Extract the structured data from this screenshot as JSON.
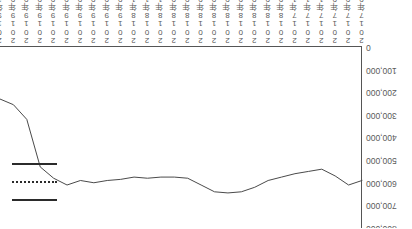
{
  "chart_data": {
    "type": "line",
    "title": "",
    "subtitle": "",
    "xlabel": "",
    "ylabel": "",
    "orientation": "rotated-180",
    "grid": false,
    "legend_position": "plot-left",
    "ylim": [
      0,
      800000
    ],
    "ytick_labels": [
      "0",
      "100,000",
      "200,000",
      "300,000",
      "400,000",
      "500,000",
      "600,000",
      "700,000",
      "800,000"
    ],
    "ytick_values": [
      0,
      100000,
      200000,
      300000,
      400000,
      500000,
      600000,
      700000,
      800000
    ],
    "categories": [
      "2017年07月",
      "2017年08月",
      "2017年09月",
      "2017年10月",
      "2017年11月",
      "2017年12月",
      "2018年01月",
      "2018年02月",
      "2018年03月",
      "2018年04月",
      "2018年05月",
      "2018年06月",
      "2018年07月",
      "2018年08月",
      "2018年09月",
      "2018年10月",
      "2018年11月",
      "2018年12月",
      "2019年01月",
      "2019年02月",
      "2019年03月",
      "2019年04月",
      "2019年05月",
      "2019年06月",
      "2019年07月",
      "2019年08月",
      "2019年09月",
      "2019年10月"
    ],
    "series": [
      {
        "name": "",
        "style": "solid",
        "color": "#4a4a4a",
        "values": [
          590000,
          610000,
          570000,
          540000,
          550000,
          560000,
          575000,
          590000,
          620000,
          640000,
          645000,
          640000,
          610000,
          580000,
          575000,
          575000,
          580000,
          575000,
          585000,
          590000,
          600000,
          590000,
          610000,
          580000,
          530000,
          320000,
          255000,
          230000
        ]
      }
    ],
    "legend_entries": [
      {
        "label": "",
        "style": "solid"
      },
      {
        "label": "",
        "style": "dotted"
      },
      {
        "label": "",
        "style": "solid"
      }
    ]
  }
}
